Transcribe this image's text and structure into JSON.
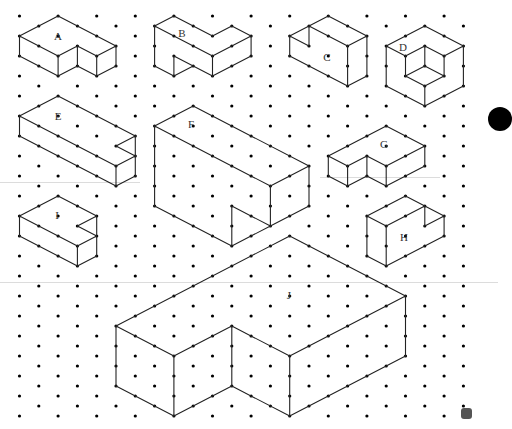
{
  "grid": {
    "origin_x": 19.5,
    "origin_y": 16,
    "step_x": 19.3,
    "step_y": 10,
    "cols": 24,
    "rows": 41,
    "dot_color": "#000000",
    "line_color": "#222222"
  },
  "shapes": [
    {
      "id": "A",
      "label": "A",
      "label_pos": [
        58,
        36
      ],
      "edges": [
        [
          [
            0,
            2
          ],
          [
            2,
            0
          ]
        ],
        [
          [
            2,
            0
          ],
          [
            5,
            3
          ]
        ],
        [
          [
            0,
            2
          ],
          [
            2,
            4
          ]
        ],
        [
          [
            2,
            4
          ],
          [
            3,
            3
          ]
        ],
        [
          [
            3,
            3
          ],
          [
            4,
            4
          ]
        ],
        [
          [
            4,
            4
          ],
          [
            5,
            3
          ]
        ],
        [
          [
            0,
            2
          ],
          [
            0,
            4
          ]
        ],
        [
          [
            2,
            4
          ],
          [
            2,
            6
          ]
        ],
        [
          [
            3,
            3
          ],
          [
            3,
            5
          ]
        ],
        [
          [
            4,
            4
          ],
          [
            4,
            6
          ]
        ],
        [
          [
            5,
            3
          ],
          [
            5,
            5
          ]
        ],
        [
          [
            0,
            4
          ],
          [
            2,
            6
          ]
        ],
        [
          [
            2,
            6
          ],
          [
            3,
            5
          ]
        ],
        [
          [
            3,
            5
          ],
          [
            4,
            6
          ]
        ],
        [
          [
            4,
            6
          ],
          [
            5,
            5
          ]
        ]
      ]
    },
    {
      "id": "B",
      "label": "B",
      "label_pos": [
        182,
        33
      ],
      "edges": [
        [
          [
            7,
            1
          ],
          [
            8,
            0
          ]
        ],
        [
          [
            8,
            0
          ],
          [
            10,
            2
          ]
        ],
        [
          [
            10,
            2
          ],
          [
            11,
            1
          ]
        ],
        [
          [
            11,
            1
          ],
          [
            12,
            2
          ]
        ],
        [
          [
            7,
            1
          ],
          [
            10,
            4
          ]
        ],
        [
          [
            10,
            4
          ],
          [
            12,
            2
          ]
        ],
        [
          [
            7,
            1
          ],
          [
            7,
            5
          ]
        ],
        [
          [
            7,
            5
          ],
          [
            8,
            6
          ]
        ],
        [
          [
            8,
            4
          ],
          [
            8,
            6
          ]
        ],
        [
          [
            8,
            4
          ],
          [
            9,
            5
          ]
        ],
        [
          [
            8,
            6
          ],
          [
            9,
            5
          ]
        ],
        [
          [
            9,
            5
          ],
          [
            10,
            6
          ]
        ],
        [
          [
            10,
            4
          ],
          [
            10,
            6
          ]
        ],
        [
          [
            12,
            2
          ],
          [
            12,
            4
          ]
        ],
        [
          [
            10,
            6
          ],
          [
            12,
            4
          ]
        ]
      ]
    },
    {
      "id": "C",
      "label": "C",
      "label_pos": [
        327,
        57
      ],
      "edges": [
        [
          [
            14,
            2
          ],
          [
            15,
            1
          ]
        ],
        [
          [
            15,
            1
          ],
          [
            16,
            0
          ]
        ],
        [
          [
            16,
            0
          ],
          [
            18,
            2
          ]
        ],
        [
          [
            15,
            1
          ],
          [
            17,
            3
          ]
        ],
        [
          [
            17,
            3
          ],
          [
            18,
            2
          ]
        ],
        [
          [
            14,
            2
          ],
          [
            15,
            3
          ]
        ],
        [
          [
            15,
            1
          ],
          [
            15,
            3
          ]
        ],
        [
          [
            14,
            2
          ],
          [
            14,
            4
          ]
        ],
        [
          [
            14,
            4
          ],
          [
            17,
            7
          ]
        ],
        [
          [
            17,
            3
          ],
          [
            17,
            7
          ]
        ],
        [
          [
            17,
            7
          ],
          [
            18,
            6
          ]
        ],
        [
          [
            18,
            2
          ],
          [
            18,
            6
          ]
        ]
      ]
    },
    {
      "id": "D",
      "label": "D",
      "label_pos": [
        403,
        47
      ],
      "edges": [
        [
          [
            19,
            3
          ],
          [
            21,
            1
          ]
        ],
        [
          [
            21,
            1
          ],
          [
            23,
            3
          ]
        ],
        [
          [
            19,
            3
          ],
          [
            20,
            4
          ]
        ],
        [
          [
            20,
            4
          ],
          [
            21,
            3
          ]
        ],
        [
          [
            21,
            3
          ],
          [
            22,
            4
          ]
        ],
        [
          [
            22,
            4
          ],
          [
            23,
            3
          ]
        ],
        [
          [
            19,
            3
          ],
          [
            19,
            7
          ]
        ],
        [
          [
            23,
            3
          ],
          [
            23,
            7
          ]
        ],
        [
          [
            19,
            7
          ],
          [
            21,
            9
          ]
        ],
        [
          [
            21,
            9
          ],
          [
            23,
            7
          ]
        ],
        [
          [
            20,
            4
          ],
          [
            20,
            6
          ]
        ],
        [
          [
            22,
            4
          ],
          [
            22,
            6
          ]
        ],
        [
          [
            21,
            3
          ],
          [
            21,
            5
          ]
        ],
        [
          [
            20,
            6
          ],
          [
            21,
            5
          ]
        ],
        [
          [
            21,
            5
          ],
          [
            22,
            6
          ]
        ],
        [
          [
            20,
            6
          ],
          [
            21,
            7
          ]
        ],
        [
          [
            21,
            7
          ],
          [
            22,
            6
          ]
        ],
        [
          [
            21,
            7
          ],
          [
            21,
            9
          ]
        ]
      ]
    },
    {
      "id": "E",
      "label": "E",
      "label_pos": [
        58,
        116
      ],
      "edges": [
        [
          [
            0,
            10
          ],
          [
            2,
            8
          ]
        ],
        [
          [
            2,
            8
          ],
          [
            6,
            12
          ]
        ],
        [
          [
            0,
            10
          ],
          [
            5,
            15
          ]
        ],
        [
          [
            5,
            15
          ],
          [
            6,
            14
          ]
        ],
        [
          [
            5,
            13
          ],
          [
            6,
            12
          ]
        ],
        [
          [
            5,
            13
          ],
          [
            6,
            14
          ]
        ],
        [
          [
            6,
            12
          ],
          [
            6,
            16
          ]
        ],
        [
          [
            0,
            10
          ],
          [
            0,
            12
          ]
        ],
        [
          [
            0,
            12
          ],
          [
            5,
            17
          ]
        ],
        [
          [
            5,
            15
          ],
          [
            5,
            17
          ]
        ],
        [
          [
            5,
            17
          ],
          [
            6,
            16
          ]
        ]
      ]
    },
    {
      "id": "F",
      "label": "F",
      "label_pos": [
        191,
        124
      ],
      "edges": [
        [
          [
            7,
            11
          ],
          [
            9,
            9
          ]
        ],
        [
          [
            9,
            9
          ],
          [
            15,
            15
          ]
        ],
        [
          [
            7,
            11
          ],
          [
            13,
            17
          ]
        ],
        [
          [
            13,
            17
          ],
          [
            15,
            15
          ]
        ],
        [
          [
            7,
            11
          ],
          [
            7,
            19
          ]
        ],
        [
          [
            7,
            19
          ],
          [
            11,
            23
          ]
        ],
        [
          [
            11,
            19
          ],
          [
            11,
            23
          ]
        ],
        [
          [
            11,
            19
          ],
          [
            13,
            21
          ]
        ],
        [
          [
            13,
            17
          ],
          [
            13,
            21
          ]
        ],
        [
          [
            11,
            23
          ],
          [
            13,
            21
          ]
        ],
        [
          [
            13,
            21
          ],
          [
            15,
            19
          ]
        ],
        [
          [
            15,
            15
          ],
          [
            15,
            19
          ]
        ]
      ]
    },
    {
      "id": "G",
      "label": "G",
      "label_pos": [
        384,
        144
      ],
      "edges": [
        [
          [
            16,
            14
          ],
          [
            19,
            11
          ]
        ],
        [
          [
            19,
            11
          ],
          [
            21,
            13
          ]
        ],
        [
          [
            16,
            14
          ],
          [
            17,
            15
          ]
        ],
        [
          [
            17,
            15
          ],
          [
            18,
            14
          ]
        ],
        [
          [
            18,
            14
          ],
          [
            19,
            15
          ]
        ],
        [
          [
            19,
            15
          ],
          [
            21,
            13
          ]
        ],
        [
          [
            16,
            14
          ],
          [
            16,
            16
          ]
        ],
        [
          [
            17,
            15
          ],
          [
            17,
            17
          ]
        ],
        [
          [
            18,
            14
          ],
          [
            18,
            16
          ]
        ],
        [
          [
            19,
            15
          ],
          [
            19,
            17
          ]
        ],
        [
          [
            21,
            13
          ],
          [
            21,
            15
          ]
        ],
        [
          [
            16,
            16
          ],
          [
            17,
            17
          ]
        ],
        [
          [
            17,
            17
          ],
          [
            18,
            16
          ]
        ],
        [
          [
            18,
            16
          ],
          [
            19,
            17
          ]
        ],
        [
          [
            19,
            17
          ],
          [
            21,
            15
          ]
        ]
      ]
    },
    {
      "id": "H",
      "label": "H",
      "label_pos": [
        404,
        237
      ],
      "edges": [
        [
          [
            18,
            20
          ],
          [
            20,
            18
          ]
        ],
        [
          [
            20,
            18
          ],
          [
            22,
            20
          ]
        ],
        [
          [
            18,
            20
          ],
          [
            19,
            21
          ]
        ],
        [
          [
            19,
            21
          ],
          [
            21,
            19
          ]
        ],
        [
          [
            21,
            19
          ],
          [
            21,
            21
          ]
        ],
        [
          [
            21,
            21
          ],
          [
            22,
            20
          ]
        ],
        [
          [
            22,
            20
          ],
          [
            22,
            22
          ]
        ],
        [
          [
            18,
            20
          ],
          [
            18,
            24
          ]
        ],
        [
          [
            19,
            21
          ],
          [
            19,
            25
          ]
        ],
        [
          [
            18,
            24
          ],
          [
            19,
            25
          ]
        ],
        [
          [
            19,
            25
          ],
          [
            22,
            22
          ]
        ]
      ]
    },
    {
      "id": "I",
      "label": "I",
      "label_pos": [
        57,
        215
      ],
      "edges": [
        [
          [
            0,
            20
          ],
          [
            2,
            18
          ]
        ],
        [
          [
            2,
            18
          ],
          [
            4,
            20
          ]
        ],
        [
          [
            3,
            21
          ],
          [
            4,
            20
          ]
        ],
        [
          [
            3,
            21
          ],
          [
            4,
            22
          ]
        ],
        [
          [
            0,
            20
          ],
          [
            3,
            23
          ]
        ],
        [
          [
            3,
            23
          ],
          [
            4,
            22
          ]
        ],
        [
          [
            0,
            20
          ],
          [
            0,
            22
          ]
        ],
        [
          [
            3,
            23
          ],
          [
            3,
            25
          ]
        ],
        [
          [
            4,
            20
          ],
          [
            4,
            24
          ]
        ],
        [
          [
            0,
            22
          ],
          [
            3,
            25
          ]
        ],
        [
          [
            3,
            25
          ],
          [
            4,
            24
          ]
        ]
      ]
    },
    {
      "id": "J",
      "label": "J",
      "label_pos": [
        289,
        295
      ],
      "edges": [
        [
          [
            5,
            31
          ],
          [
            14,
            22
          ]
        ],
        [
          [
            14,
            22
          ],
          [
            20,
            28
          ]
        ],
        [
          [
            5,
            31
          ],
          [
            8,
            34
          ]
        ],
        [
          [
            8,
            34
          ],
          [
            11,
            31
          ]
        ],
        [
          [
            11,
            31
          ],
          [
            14,
            34
          ]
        ],
        [
          [
            14,
            34
          ],
          [
            20,
            28
          ]
        ],
        [
          [
            5,
            31
          ],
          [
            5,
            37
          ]
        ],
        [
          [
            8,
            34
          ],
          [
            8,
            40
          ]
        ],
        [
          [
            11,
            31
          ],
          [
            11,
            37
          ]
        ],
        [
          [
            14,
            34
          ],
          [
            14,
            40
          ]
        ],
        [
          [
            20,
            28
          ],
          [
            20,
            34
          ]
        ],
        [
          [
            5,
            37
          ],
          [
            8,
            40
          ]
        ],
        [
          [
            8,
            40
          ],
          [
            11,
            37
          ]
        ],
        [
          [
            11,
            37
          ],
          [
            14,
            40
          ]
        ],
        [
          [
            14,
            40
          ],
          [
            20,
            34
          ]
        ]
      ]
    }
  ],
  "artifacts": {
    "scanlines": [
      {
        "x": 0,
        "y": 182,
        "w": 140
      },
      {
        "x": 320,
        "y": 177,
        "w": 120
      },
      {
        "x": 0,
        "y": 282,
        "w": 498
      }
    ]
  }
}
